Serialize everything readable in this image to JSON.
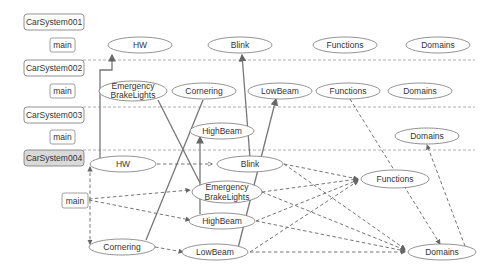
{
  "systems": [
    {
      "label": "CarSystem001",
      "main_label": "main",
      "nodes": [
        "HW",
        "Blink",
        "Functions",
        "Domains"
      ]
    },
    {
      "label": "CarSystem002",
      "main_label": "main",
      "nodes": [
        "Emergency",
        "BrakeLights",
        "Cornering",
        "LowBeam",
        "Functions",
        "Domains"
      ]
    },
    {
      "label": "CarSystem003",
      "main_label": "main",
      "nodes": [
        "HighBeam",
        "Domains"
      ]
    },
    {
      "label": "CarSystem004",
      "main_label": "main",
      "active": true,
      "nodes": [
        "HW",
        "Blink",
        "Emergency",
        "BrakeLights",
        "Functions",
        "HighBeam",
        "Cornering",
        "LowBeam",
        "Domains"
      ]
    }
  ],
  "labels": {
    "s1": "CarSystem001",
    "s2": "CarSystem002",
    "s3": "CarSystem003",
    "s4": "CarSystem004",
    "main": "main",
    "hw": "HW",
    "blink": "Blink",
    "functions": "Functions",
    "domains": "Domains",
    "emergency": "Emergency",
    "brakelights": "BrakeLights",
    "cornering": "Cornering",
    "lowbeam": "LowBeam",
    "highbeam": "HighBeam"
  },
  "colors": {
    "active_system_fill": "#d9d9d9",
    "stroke": "#777777",
    "background": "#ffffff"
  }
}
